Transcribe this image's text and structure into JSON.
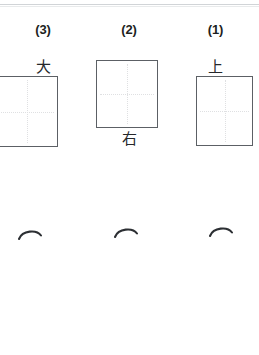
{
  "worksheet": {
    "title": "Kanji writing practice worksheet",
    "background_color": "#ffffff",
    "page_edge_color": "#c9ccd0",
    "box_border_color": "#5c6065",
    "guide_line_color": "#dfe0e2",
    "text_color": "#1d1f22"
  },
  "exercises": [
    {
      "number_label": "(3)",
      "kanji": "大",
      "kanji_position": "above",
      "box": {
        "left": -4,
        "top": 76,
        "width": 62,
        "height": 71,
        "clipped_left": true
      },
      "stroke_mark": {
        "left": 17,
        "top": 227
      }
    },
    {
      "number_label": "(2)",
      "kanji": "右",
      "kanji_position": "below",
      "box": {
        "left": 96,
        "top": 60,
        "width": 62,
        "height": 68,
        "clipped_left": false
      },
      "stroke_mark": {
        "left": 113,
        "top": 225
      }
    },
    {
      "number_label": "(1)",
      "kanji": "上",
      "kanji_position": "above",
      "box": {
        "left": 196,
        "top": 76,
        "width": 57,
        "height": 70,
        "clipped_left": false
      },
      "stroke_mark": {
        "left": 208,
        "top": 224
      }
    }
  ]
}
